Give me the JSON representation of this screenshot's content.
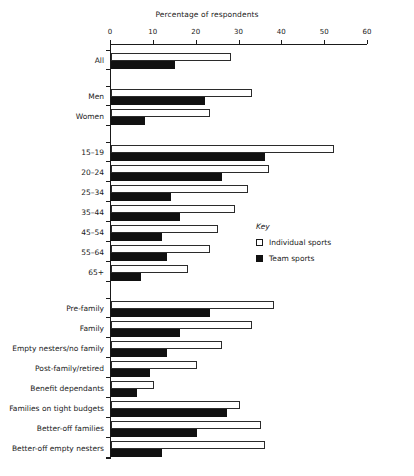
{
  "chart_data": {
    "type": "bar",
    "orientation": "horizontal",
    "title": "Percentage of respondents",
    "xlabel": "",
    "ylabel": "",
    "xlim": [
      0,
      60
    ],
    "xticks": [
      0,
      10,
      20,
      30,
      40,
      50,
      60
    ],
    "xtick_labels": [
      "0",
      "10",
      "20",
      "30",
      "40",
      "50",
      "60"
    ],
    "grid": false,
    "legend_title": "Key",
    "legend_position": "right-middle",
    "categories": [
      "All",
      "Men",
      "Women",
      "15–19",
      "20–24",
      "25–34",
      "35–44",
      "45–54",
      "55–64",
      "65+",
      "Pre-family",
      "Family",
      "Empty nesters/no family",
      "Post-family/retired",
      "Benefit dependants",
      "Families on tight budgets",
      "Better-off families",
      "Better-off empty nesters"
    ],
    "groups": [
      {
        "name": "overall",
        "categories": [
          "All"
        ]
      },
      {
        "name": "sex",
        "categories": [
          "Men",
          "Women"
        ]
      },
      {
        "name": "age",
        "categories": [
          "15–19",
          "20–24",
          "25–34",
          "35–44",
          "45–54",
          "55–64",
          "65+"
        ]
      },
      {
        "name": "lifestage",
        "categories": [
          "Pre-family",
          "Family",
          "Empty nesters/no family",
          "Post-family/retired",
          "Benefit dependants",
          "Families on tight budgets",
          "Better-off families",
          "Better-off empty nesters"
        ]
      }
    ],
    "series": [
      {
        "name": "Individual sports",
        "color": "#ffffff",
        "edge_color": "#1a1a1a",
        "values": [
          28,
          33,
          23,
          52,
          37,
          32,
          29,
          25,
          23,
          18,
          38,
          33,
          26,
          20,
          10,
          30,
          35,
          36
        ]
      },
      {
        "name": "Team sports",
        "color": "#111111",
        "edge_color": "#111111",
        "values": [
          15,
          22,
          8,
          36,
          26,
          14,
          16,
          12,
          13,
          7,
          23,
          16,
          13,
          9,
          6,
          27,
          20,
          12
        ]
      }
    ]
  },
  "legend": {
    "title": "Key",
    "items": [
      {
        "label": "Individual sports",
        "swatch": "individual"
      },
      {
        "label": "Team sports",
        "swatch": "team"
      }
    ]
  }
}
